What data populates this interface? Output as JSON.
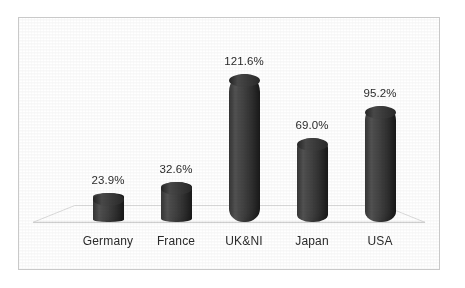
{
  "chart_data": {
    "type": "bar",
    "title": "",
    "subtitle": "",
    "xlabel": "",
    "ylabel": "",
    "grid": false,
    "legend": "none",
    "style": "3d-cylinder",
    "ylim": [
      0,
      130
    ],
    "categories": [
      "Germany",
      "France",
      "UK&NI",
      "Japan",
      "USA"
    ],
    "values": [
      23.9,
      32.6,
      121.6,
      69.0,
      95.2
    ],
    "value_labels": [
      "23.9%",
      "32.6%",
      "121.6%",
      "69.0%",
      "95.2%"
    ],
    "series": [
      {
        "name": "",
        "values": [
          23.9,
          32.6,
          121.6,
          69.0,
          95.2
        ]
      }
    ]
  },
  "colors": {
    "bar": "#3c3c3c",
    "bar_top": "#343434",
    "text": "#2b2b2b",
    "frame_border": "#c9c9c9",
    "floor_edge": "#d2d2d2",
    "background": "#ffffff"
  }
}
